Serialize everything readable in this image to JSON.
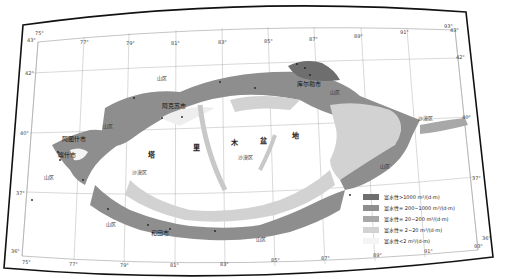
{
  "map": {
    "colors": {
      "frame": "#111111",
      "grid": "#9a9a9a",
      "class1": "#6e6e6e",
      "class2": "#8e8e8e",
      "class3": "#a8a8a8",
      "class4": "#d2d2d2",
      "class5": "#f4f4f4"
    },
    "top_ticks": [
      "75°",
      "77°",
      "79°",
      "81°",
      "83°",
      "85°",
      "87°",
      "89°",
      "91°",
      "93°"
    ],
    "bottom_ticks": [
      "75°",
      "77°",
      "79°",
      "81°",
      "83°",
      "85°",
      "87°",
      "89°",
      "91°",
      "93°"
    ],
    "left_ticks": [
      "43°",
      "42°",
      "40°",
      "37°",
      "36°"
    ],
    "right_ticks": [
      "43°",
      "42°",
      "40°",
      "37°",
      "36°"
    ],
    "basin_name": [
      "塔",
      "里",
      "木",
      "盆",
      "地"
    ],
    "cities": {
      "aksu": "阿克苏市",
      "korla": "库尔勒市",
      "artux": "阿图什市",
      "kashgar": "喀什市",
      "hotan": "和田市"
    },
    "regions": {
      "mountain": "山区",
      "desert": "沙漠区"
    },
    "legend": [
      {
        "label": "富水性>1000 m³/(d·m)",
        "color": "#6e6e6e"
      },
      {
        "label": "富水性= 200~1000 m³/(d·m)",
        "color": "#8e8e8e"
      },
      {
        "label": "富水性= 20~200 m³/(d·m)",
        "color": "#a8a8a8"
      },
      {
        "label": "富水性= 2~20 m³/(d·m)",
        "color": "#d2d2d2"
      },
      {
        "label": "富水性<2 m³/(d·m)",
        "color": "#f4f4f4"
      }
    ]
  }
}
